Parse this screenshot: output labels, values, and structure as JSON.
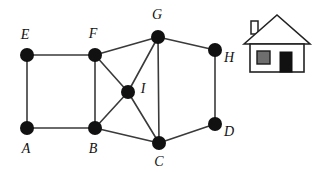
{
  "figure": {
    "width": 314,
    "height": 172,
    "background_color": "#ffffff"
  },
  "graph": {
    "node_color": "#111111",
    "edge_color": "#3a3a3a",
    "node_radius": 7,
    "nodes": [
      {
        "id": "A",
        "label": "A",
        "cx": 27,
        "cy": 128,
        "label_x": 26,
        "label_y": 150
      },
      {
        "id": "B",
        "label": "B",
        "cx": 95,
        "cy": 128,
        "label_x": 93,
        "label_y": 150
      },
      {
        "id": "C",
        "label": "C",
        "cx": 159,
        "cy": 143,
        "label_x": 159,
        "label_y": 163
      },
      {
        "id": "D",
        "label": "D",
        "cx": 215,
        "cy": 124,
        "label_x": 229,
        "label_y": 133
      },
      {
        "id": "E",
        "label": "E",
        "cx": 27,
        "cy": 55,
        "label_x": 25,
        "label_y": 36
      },
      {
        "id": "F",
        "label": "F",
        "cx": 95,
        "cy": 55,
        "label_x": 93,
        "label_y": 35
      },
      {
        "id": "G",
        "label": "G",
        "cx": 158,
        "cy": 37,
        "label_x": 157,
        "label_y": 16
      },
      {
        "id": "H",
        "label": "H",
        "cx": 215,
        "cy": 50,
        "label_x": 229,
        "label_y": 59
      },
      {
        "id": "I",
        "label": "I",
        "cx": 128,
        "cy": 92,
        "label_x": 143,
        "label_y": 90
      }
    ],
    "edges": [
      {
        "from": "A",
        "to": "E"
      },
      {
        "from": "A",
        "to": "B"
      },
      {
        "from": "E",
        "to": "F"
      },
      {
        "from": "B",
        "to": "F"
      },
      {
        "from": "B",
        "to": "I"
      },
      {
        "from": "B",
        "to": "C"
      },
      {
        "from": "F",
        "to": "I"
      },
      {
        "from": "F",
        "to": "G"
      },
      {
        "from": "I",
        "to": "G"
      },
      {
        "from": "I",
        "to": "C"
      },
      {
        "from": "G",
        "to": "C"
      },
      {
        "from": "G",
        "to": "H"
      },
      {
        "from": "H",
        "to": "D"
      },
      {
        "from": "C",
        "to": "D"
      }
    ]
  },
  "house_icon": {
    "name": "house-icon",
    "wall_color": "#ffffff",
    "outline_color": "#222222",
    "window_color": "#6e6e6e",
    "door_color": "#111111",
    "bounds": {
      "x": 244,
      "y": 14,
      "width": 66,
      "height": 58
    }
  }
}
